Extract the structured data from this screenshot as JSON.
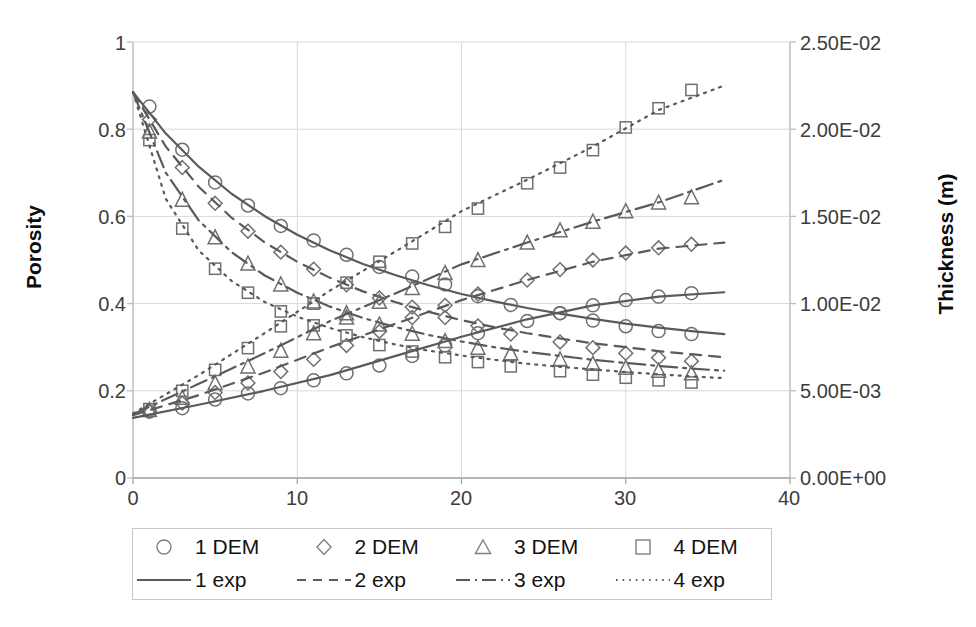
{
  "chart_data": {
    "type": "scatter",
    "title": "",
    "xlabel": "",
    "ylabel": "Porosity",
    "ylabel_right": "Thickness (m)",
    "xlim": [
      0,
      40
    ],
    "ylim": [
      0,
      1
    ],
    "ylim_right": [
      0,
      0.025
    ],
    "grid": true,
    "legend_position": "bottom",
    "xticks": [
      "0",
      "10",
      "20",
      "30",
      "40"
    ],
    "xtick_values": [
      0,
      10,
      20,
      30,
      40
    ],
    "yticks_left": [
      "0",
      "0.2",
      "0.4",
      "0.6",
      "0.8",
      "1"
    ],
    "ytick_values_left": [
      0,
      0.2,
      0.4,
      0.6,
      0.8,
      1
    ],
    "yticks_right": [
      "0.00E+00",
      "5.00E-03",
      "1.00E-02",
      "1.50E-02",
      "2.00E-02",
      "2.50E-02"
    ],
    "ytick_values_right": [
      0,
      0.005,
      0.01,
      0.015,
      0.02,
      0.025
    ],
    "series": [
      {
        "name": "1 DEM",
        "axis": "left",
        "marker": "circle",
        "x": [
          1,
          3,
          5,
          7,
          9,
          11,
          13,
          15,
          17,
          19,
          21,
          23,
          26,
          28,
          30,
          32,
          34
        ],
        "values": [
          0.852,
          0.753,
          0.678,
          0.625,
          0.578,
          0.545,
          0.512,
          0.484,
          0.462,
          0.444,
          0.417,
          0.397,
          0.378,
          0.361,
          0.348,
          0.337,
          0.33
        ]
      },
      {
        "name": "2 DEM",
        "axis": "left",
        "marker": "diamond",
        "x": [
          1,
          3,
          5,
          7,
          9,
          11,
          13,
          15,
          17,
          19,
          21,
          23,
          26,
          28,
          30,
          32,
          34
        ],
        "values": [
          0.822,
          0.712,
          0.63,
          0.566,
          0.518,
          0.479,
          0.443,
          0.413,
          0.392,
          0.368,
          0.349,
          0.33,
          0.312,
          0.299,
          0.286,
          0.276,
          0.268
        ]
      },
      {
        "name": "3 DEM",
        "axis": "left",
        "marker": "triangle",
        "x": [
          1,
          3,
          5,
          7,
          9,
          11,
          13,
          15,
          17,
          19,
          21,
          23,
          26,
          28,
          30,
          32,
          34
        ],
        "values": [
          0.795,
          0.638,
          0.552,
          0.492,
          0.444,
          0.405,
          0.378,
          0.352,
          0.331,
          0.314,
          0.299,
          0.286,
          0.272,
          0.262,
          0.253,
          0.246,
          0.24
        ]
      },
      {
        "name": "4 DEM",
        "axis": "left",
        "marker": "square",
        "x": [
          1,
          3,
          5,
          7,
          9,
          11,
          13,
          15,
          17,
          19,
          21,
          23,
          26,
          28,
          30,
          32,
          34
        ],
        "values": [
          0.775,
          0.572,
          0.48,
          0.425,
          0.382,
          0.35,
          0.327,
          0.305,
          0.29,
          0.277,
          0.266,
          0.256,
          0.245,
          0.237,
          0.23,
          0.224,
          0.219
        ]
      },
      {
        "name": "1 exp",
        "axis": "left",
        "line": "solid",
        "x": [
          0,
          2,
          4,
          6,
          8,
          10,
          12,
          14,
          16,
          18,
          20,
          22,
          24,
          26,
          28,
          30,
          32,
          34,
          36
        ],
        "values": [
          0.885,
          0.79,
          0.714,
          0.652,
          0.601,
          0.558,
          0.522,
          0.491,
          0.465,
          0.442,
          0.422,
          0.405,
          0.39,
          0.377,
          0.365,
          0.354,
          0.345,
          0.337,
          0.33
        ]
      },
      {
        "name": "2 exp",
        "axis": "left",
        "line": "dashed",
        "x": [
          0,
          2,
          4,
          6,
          8,
          10,
          12,
          14,
          16,
          18,
          20,
          22,
          24,
          26,
          28,
          30,
          32,
          34,
          36
        ],
        "values": [
          0.885,
          0.76,
          0.668,
          0.597,
          0.541,
          0.496,
          0.459,
          0.428,
          0.403,
          0.381,
          0.362,
          0.346,
          0.332,
          0.32,
          0.309,
          0.3,
          0.291,
          0.284,
          0.277
        ]
      },
      {
        "name": "3 exp",
        "axis": "left",
        "line": "dashdot",
        "x": [
          0,
          2,
          4,
          6,
          8,
          10,
          12,
          14,
          16,
          18,
          20,
          22,
          24,
          26,
          28,
          30,
          32,
          34,
          36
        ],
        "values": [
          0.885,
          0.7,
          0.591,
          0.518,
          0.465,
          0.425,
          0.393,
          0.367,
          0.346,
          0.328,
          0.313,
          0.3,
          0.289,
          0.28,
          0.271,
          0.264,
          0.257,
          0.251,
          0.246
        ]
      },
      {
        "name": "4 exp",
        "axis": "left",
        "line": "dotted",
        "x": [
          0,
          2,
          4,
          6,
          8,
          10,
          12,
          14,
          16,
          18,
          20,
          22,
          24,
          26,
          28,
          30,
          32,
          34,
          36
        ],
        "values": [
          0.885,
          0.64,
          0.522,
          0.452,
          0.404,
          0.37,
          0.344,
          0.323,
          0.306,
          0.292,
          0.281,
          0.271,
          0.262,
          0.255,
          0.249,
          0.243,
          0.238,
          0.233,
          0.229
        ]
      },
      {
        "name": "1 DEM",
        "axis": "right",
        "marker": "circle",
        "x": [
          1,
          3,
          5,
          7,
          9,
          11,
          13,
          15,
          17,
          19,
          21,
          24,
          26,
          28,
          30,
          32,
          34
        ],
        "values": [
          0.0038,
          0.004,
          0.0045,
          0.00485,
          0.00515,
          0.0056,
          0.006,
          0.00645,
          0.007,
          0.0076,
          0.0083,
          0.009,
          0.00945,
          0.0099,
          0.0102,
          0.0104,
          0.0106
        ]
      },
      {
        "name": "2 DEM",
        "axis": "right",
        "marker": "diamond",
        "x": [
          1,
          3,
          5,
          7,
          9,
          11,
          13,
          15,
          17,
          19,
          21,
          24,
          26,
          28,
          30,
          32,
          34
        ],
        "values": [
          0.00385,
          0.0043,
          0.0049,
          0.00545,
          0.0061,
          0.0068,
          0.0076,
          0.0084,
          0.0092,
          0.0099,
          0.01055,
          0.01135,
          0.01195,
          0.0125,
          0.0129,
          0.0132,
          0.0134
        ]
      },
      {
        "name": "3 DEM",
        "axis": "right",
        "marker": "triangle",
        "x": [
          1,
          3,
          5,
          7,
          9,
          11,
          13,
          15,
          17,
          19,
          21,
          24,
          26,
          28,
          30,
          32,
          34
        ],
        "values": [
          0.0039,
          0.0046,
          0.00545,
          0.0064,
          0.0073,
          0.0083,
          0.0092,
          0.0101,
          0.0109,
          0.01175,
          0.0125,
          0.0135,
          0.0142,
          0.0147,
          0.0153,
          0.0158,
          0.0161
        ]
      },
      {
        "name": "4 DEM",
        "axis": "right",
        "marker": "square",
        "x": [
          1,
          3,
          5,
          7,
          9,
          11,
          13,
          15,
          17,
          19,
          21,
          24,
          26,
          28,
          30,
          32,
          34
        ],
        "values": [
          0.00395,
          0.005,
          0.0062,
          0.00745,
          0.0087,
          0.01,
          0.0112,
          0.0124,
          0.01345,
          0.0144,
          0.01545,
          0.0169,
          0.0178,
          0.0188,
          0.0201,
          0.0212,
          0.02225
        ]
      },
      {
        "name": "1 exp",
        "axis": "right",
        "line": "solid",
        "x": [
          0,
          4,
          8,
          12,
          16,
          20,
          24,
          28,
          32,
          36
        ],
        "values": [
          0.00345,
          0.0042,
          0.005,
          0.0059,
          0.007,
          0.0081,
          0.0091,
          0.0099,
          0.0104,
          0.01065
        ]
      },
      {
        "name": "2 exp",
        "axis": "right",
        "line": "dashed",
        "x": [
          0,
          4,
          8,
          12,
          16,
          20,
          24,
          28,
          32,
          36
        ],
        "values": [
          0.0036,
          0.00475,
          0.00605,
          0.0075,
          0.00885,
          0.0102,
          0.01135,
          0.0124,
          0.01315,
          0.0135
        ]
      },
      {
        "name": "3 exp",
        "axis": "right",
        "line": "dashdot",
        "x": [
          0,
          4,
          8,
          12,
          16,
          20,
          24,
          28,
          32,
          36
        ],
        "values": [
          0.00365,
          0.0054,
          0.00715,
          0.009,
          0.0106,
          0.01225,
          0.0135,
          0.0147,
          0.0158,
          0.0171
        ]
      },
      {
        "name": "4 exp",
        "axis": "right",
        "line": "dotted",
        "x": [
          0,
          4,
          8,
          12,
          16,
          20,
          24,
          28,
          32,
          36
        ],
        "values": [
          0.0037,
          0.0059,
          0.0083,
          0.01075,
          0.013,
          0.0153,
          0.0171,
          0.019,
          0.0211,
          0.0225
        ]
      }
    ]
  },
  "axes": {
    "left_title": "Porosity",
    "right_title": "Thickness (m)",
    "x_ticks": [
      "0",
      "10",
      "20",
      "30",
      "40"
    ],
    "y_ticks_left": [
      "1",
      "0.8",
      "0.6",
      "0.4",
      "0.2",
      "0"
    ],
    "y_ticks_right": [
      "2.50E-02",
      "2.00E-02",
      "1.50E-02",
      "1.00E-02",
      "5.00E-03",
      "0.00E+00"
    ]
  },
  "legend": {
    "markers": [
      {
        "label": "1 DEM",
        "marker": "circle"
      },
      {
        "label": "2 DEM",
        "marker": "diamond"
      },
      {
        "label": "3 DEM",
        "marker": "triangle"
      },
      {
        "label": "4 DEM",
        "marker": "square"
      }
    ],
    "lines": [
      {
        "label": "1 exp",
        "style": "solid"
      },
      {
        "label": "2 exp",
        "style": "dashed"
      },
      {
        "label": "3 exp",
        "style": "dashdot"
      },
      {
        "label": "4 exp",
        "style": "dotted"
      }
    ]
  },
  "colors": {
    "series_stroke": "#5a5a5a",
    "marker_stroke": "#707070",
    "grid": "#d9d9d9",
    "axis": "#bfbfbf",
    "text": "#1a1a1a"
  }
}
